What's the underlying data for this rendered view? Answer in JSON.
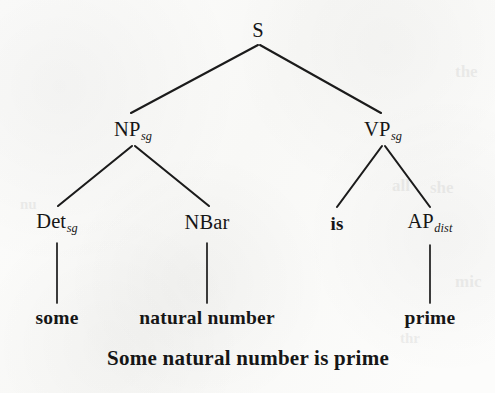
{
  "figure": {
    "kind": "phrase-structure-tree",
    "background_color": "#fcfcfb",
    "ink_color": "#161616",
    "caption": "Some natural number is prime"
  },
  "tree": {
    "nodes": [
      {
        "id": "s",
        "label": "S",
        "subscript": "",
        "type": "nonterminal",
        "x": 258,
        "y": 30
      },
      {
        "id": "np",
        "label": "NP",
        "subscript": "sg",
        "type": "nonterminal",
        "x": 133,
        "y": 130
      },
      {
        "id": "vp",
        "label": "VP",
        "subscript": "sg",
        "type": "nonterminal",
        "x": 383,
        "y": 130
      },
      {
        "id": "det",
        "label": "Det",
        "subscript": "sg",
        "type": "nonterminal",
        "x": 57,
        "y": 222
      },
      {
        "id": "nbar",
        "label": "NBar",
        "subscript": "",
        "type": "nonterminal",
        "x": 207,
        "y": 222
      },
      {
        "id": "is",
        "label": "is",
        "subscript": "",
        "type": "terminal",
        "x": 337,
        "y": 223
      },
      {
        "id": "ap",
        "label": "AP",
        "subscript": "dist",
        "type": "nonterminal",
        "x": 430,
        "y": 222
      },
      {
        "id": "some",
        "label": "some",
        "subscript": "",
        "type": "lexical",
        "x": 57,
        "y": 318
      },
      {
        "id": "natnum",
        "label": "natural number",
        "subscript": "",
        "type": "lexical",
        "x": 207,
        "y": 318
      },
      {
        "id": "prime",
        "label": "prime",
        "subscript": "",
        "type": "lexical",
        "x": 430,
        "y": 318
      }
    ],
    "edges": [
      {
        "from": "s",
        "to": "np",
        "kind": "branch",
        "x1": 258,
        "y1": 45,
        "x2": 131,
        "y2": 113
      },
      {
        "from": "s",
        "to": "vp",
        "kind": "branch",
        "x1": 260,
        "y1": 45,
        "x2": 381,
        "y2": 113
      },
      {
        "from": "np",
        "to": "det",
        "kind": "branch",
        "x1": 132,
        "y1": 146,
        "x2": 58,
        "y2": 206
      },
      {
        "from": "np",
        "to": "nbar",
        "kind": "branch",
        "x1": 135,
        "y1": 146,
        "x2": 209,
        "y2": 206
      },
      {
        "from": "vp",
        "to": "is",
        "kind": "branch",
        "x1": 382,
        "y1": 146,
        "x2": 337,
        "y2": 207
      },
      {
        "from": "vp",
        "to": "ap",
        "kind": "branch",
        "x1": 385,
        "y1": 146,
        "x2": 430,
        "y2": 207
      },
      {
        "from": "det",
        "to": "some",
        "kind": "vertical",
        "x1": 57,
        "y1": 243,
        "x2": 57,
        "y2": 303
      },
      {
        "from": "nbar",
        "to": "natnum",
        "kind": "vertical",
        "x1": 207,
        "y1": 243,
        "x2": 207,
        "y2": 303
      },
      {
        "from": "ap",
        "to": "prime",
        "kind": "vertical",
        "x1": 430,
        "y1": 245,
        "x2": 430,
        "y2": 303
      }
    ]
  },
  "caption": {
    "text": "Some natural number is prime",
    "x": 248,
    "y": 358
  },
  "bleed_through": [
    {
      "text": "the",
      "x": 455,
      "y": 62,
      "size": 17,
      "rotate": 0
    },
    {
      "text": "all",
      "x": 392,
      "y": 176,
      "size": 17,
      "rotate": 0
    },
    {
      "text": "she",
      "x": 430,
      "y": 178,
      "size": 17,
      "rotate": 0
    },
    {
      "text": "mic",
      "x": 455,
      "y": 272,
      "size": 17,
      "rotate": 0
    },
    {
      "text": "thr",
      "x": 400,
      "y": 330,
      "size": 15,
      "rotate": 0
    },
    {
      "text": "nu",
      "x": 20,
      "y": 196,
      "size": 15,
      "rotate": 0
    }
  ]
}
